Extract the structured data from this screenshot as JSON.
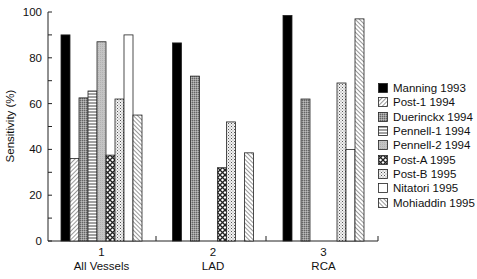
{
  "chart_data": {
    "type": "bar",
    "title": "",
    "xlabel": "",
    "ylabel": "Sensitivity (%)",
    "ylim": [
      0,
      100
    ],
    "yticks": [
      0,
      20,
      40,
      60,
      80,
      100
    ],
    "grid": false,
    "legend_position": "right",
    "categories": [
      {
        "number": "1",
        "label": "All Vessels"
      },
      {
        "number": "2",
        "label": "LAD"
      },
      {
        "number": "3",
        "label": "RCA"
      }
    ],
    "series": [
      {
        "name": "Manning 1993",
        "pattern": "solid-black",
        "values": [
          90,
          86.5,
          98.5
        ]
      },
      {
        "name": "Post-1 1994",
        "pattern": "diagonal-lines",
        "values": [
          36,
          null,
          null
        ]
      },
      {
        "name": "Duerinckx 1994",
        "pattern": "fine-crosshatch-gray",
        "values": [
          62.5,
          72,
          62
        ]
      },
      {
        "name": "Pennell-1 1994",
        "pattern": "horizontal-lines",
        "values": [
          65.5,
          null,
          null
        ]
      },
      {
        "name": "Pennell-2 1994",
        "pattern": "light-gray",
        "values": [
          87,
          null,
          null
        ]
      },
      {
        "name": "Post-A 1995",
        "pattern": "diamond-crosshatch",
        "values": [
          37.5,
          32,
          null
        ]
      },
      {
        "name": "Post-B 1995",
        "pattern": "dots",
        "values": [
          62,
          52,
          69
        ]
      },
      {
        "name": "Nitatori 1995",
        "pattern": "white",
        "values": [
          90,
          null,
          40
        ]
      },
      {
        "name": "Mohiaddin 1995",
        "pattern": "reverse-diagonal-lines",
        "values": [
          55,
          38.5,
          97
        ]
      }
    ]
  }
}
